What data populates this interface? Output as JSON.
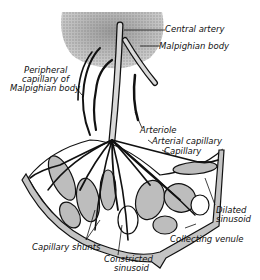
{
  "diagram": {
    "labels": {
      "central_artery": "Central artery",
      "malpighian_body": "Malpighian body",
      "peripheral_capillary_l1": "Peripheral",
      "peripheral_capillary_l2": "capillary of",
      "peripheral_capillary_l3": "Malpighian body",
      "arteriole": "Arteriole",
      "arterial_capillary": "Arterial capillary",
      "capillary": "Capillary",
      "dilated_sinusoid_l1": "Dilated",
      "dilated_sinusoid_l2": "sinusoid",
      "collecting_venule": "Collecting venule",
      "capillary_shunts": "Capillary shunts",
      "constricted_sinusoid_l1": "Constricted",
      "constricted_sinusoid_l2": "sinusoid"
    },
    "colors": {
      "ink": "#111111",
      "stipple": "#8a8a8a",
      "sinusoid_fill": "#bdbdbd",
      "background": "#ffffff"
    }
  }
}
